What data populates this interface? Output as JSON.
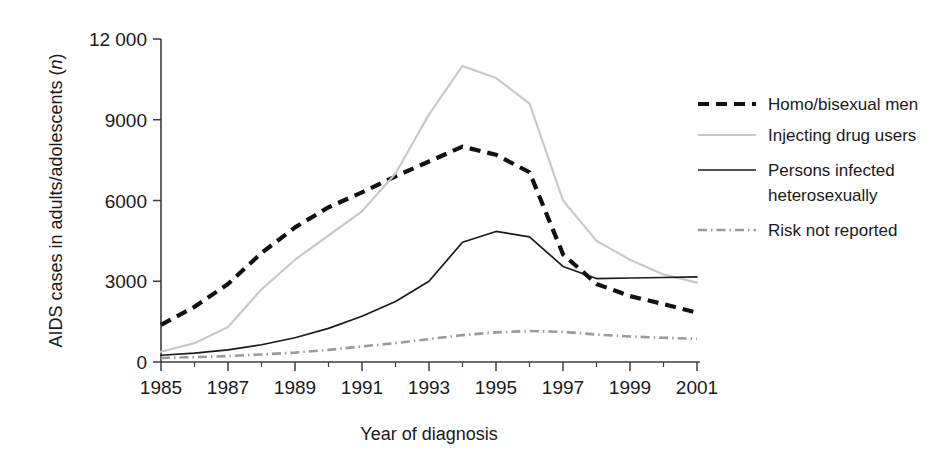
{
  "chart_data": {
    "type": "line",
    "title": "",
    "xlabel": "Year of diagnosis",
    "ylabel": "AIDS cases in adults/adolescents (n)",
    "ylabel_main": "AIDS cases in adults/adolescents (",
    "ylabel_italic": "n",
    "ylabel_tail": ")",
    "x": [
      1985,
      1986,
      1987,
      1988,
      1989,
      1990,
      1991,
      1992,
      1993,
      1994,
      1995,
      1996,
      1997,
      1998,
      1999,
      2000,
      2001
    ],
    "xlim": [
      1985,
      2001
    ],
    "ylim": [
      0,
      12000
    ],
    "xticks": [
      1985,
      1987,
      1989,
      1991,
      1993,
      1995,
      1997,
      1999,
      2001
    ],
    "xtick_labels": [
      "1985",
      "1987",
      "1989",
      "1991",
      "1993",
      "1995",
      "1997",
      "1999",
      "2001"
    ],
    "xticks_minor": [
      1986,
      1988,
      1990,
      1992,
      1994,
      1996,
      1998,
      2000
    ],
    "yticks": [
      0,
      3000,
      6000,
      9000,
      12000
    ],
    "ytick_labels": [
      "0",
      "3000",
      "6000",
      "9000",
      "12 000"
    ],
    "grid": false,
    "legend_position": "right",
    "series": [
      {
        "name": "Homo/bisexual men",
        "style": "dashed",
        "color": "#111111",
        "width": 4.2,
        "dash": "11,7",
        "values": [
          1380,
          2050,
          2900,
          4050,
          5000,
          5750,
          6300,
          6900,
          7450,
          8000,
          7700,
          7050,
          4000,
          2900,
          2450,
          2150,
          1830
        ]
      },
      {
        "name": "Injecting drug users",
        "style": "solid",
        "color": "#c8c8c8",
        "width": 2.2,
        "dash": "",
        "values": [
          380,
          700,
          1300,
          2700,
          3800,
          4700,
          5600,
          7000,
          9200,
          11000,
          10550,
          9600,
          6000,
          4500,
          3800,
          3250,
          2950
        ]
      },
      {
        "name": "Persons infected heterosexually",
        "label_line1": "Persons infected",
        "label_line2": "heterosexually",
        "style": "solid",
        "color": "#1a1a1a",
        "width": 1.7,
        "dash": "",
        "values": [
          250,
          330,
          450,
          640,
          900,
          1250,
          1700,
          2250,
          3000,
          4450,
          4850,
          4650,
          3550,
          3100,
          3120,
          3140,
          3160
        ]
      },
      {
        "name": "Risk not reported",
        "style": "dash-dot",
        "color": "#9a9a9a",
        "width": 2.6,
        "dash": "9,4,1.5,4",
        "values": [
          150,
          180,
          220,
          280,
          350,
          450,
          580,
          700,
          850,
          1000,
          1100,
          1150,
          1120,
          1020,
          950,
          900,
          860
        ]
      }
    ]
  },
  "legend": {
    "items": [
      {
        "label": "Homo/bisexual men"
      },
      {
        "label": "Injecting drug users"
      },
      {
        "label_line1": "Persons infected",
        "label_line2": "heterosexually"
      },
      {
        "label": "Risk not reported"
      }
    ]
  }
}
